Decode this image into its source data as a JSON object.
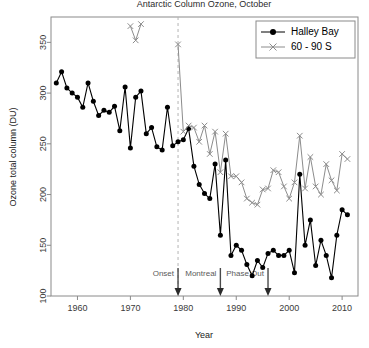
{
  "chart_data": {
    "type": "line",
    "title": "Antarctic Column Ozone, October",
    "xlabel": "Year",
    "ylabel": "Ozone total column (DU)",
    "xlim": [
      1955,
      2013
    ],
    "ylim": [
      100,
      375
    ],
    "xticks": [
      1960,
      1970,
      1980,
      1990,
      2000,
      2010
    ],
    "xticklabels": [
      "1960",
      "1970",
      "1980",
      "1990",
      "2000",
      "2010"
    ],
    "yticks": [
      100,
      150,
      200,
      250,
      300,
      350
    ],
    "yticklabels": [
      "100",
      "150",
      "200",
      "250",
      "300",
      "350"
    ],
    "grid": false,
    "legend_position": "top-right",
    "series": [
      {
        "name": "Halley Bay",
        "color": "#000000",
        "marker": "filled-circle",
        "x": [
          1956,
          1957,
          1958,
          1959,
          1960,
          1961,
          1962,
          1963,
          1964,
          1965,
          1966,
          1967,
          1968,
          1969,
          1970,
          1971,
          1972,
          1973,
          1974,
          1975,
          1976,
          1977,
          1978,
          1979,
          1980,
          1981,
          1982,
          1983,
          1984,
          1985,
          1986,
          1987,
          1988,
          1989,
          1990,
          1991,
          1992,
          1993,
          1994,
          1995,
          1996,
          1997,
          1998,
          1999,
          2000,
          2001,
          2002,
          2003,
          2004,
          2005,
          2006,
          2007,
          2008,
          2009,
          2010,
          2011
        ],
        "values": [
          310,
          321,
          305,
          300,
          296,
          286,
          310,
          292,
          278,
          283,
          281,
          287,
          263,
          306,
          246,
          296,
          302,
          260,
          266,
          247,
          244,
          286,
          248,
          252,
          254,
          265,
          228,
          210,
          201,
          196,
          230,
          160,
          234,
          140,
          150,
          145,
          131,
          120,
          135,
          128,
          142,
          145,
          140,
          140,
          145,
          123,
          220,
          150,
          175,
          130,
          155,
          140,
          118,
          160,
          185,
          180
        ]
      },
      {
        "name": "60 - 90 S",
        "color": "#8c8c8c",
        "marker": "x",
        "x": [
          1970,
          1971,
          1972,
          1979,
          1980,
          1981,
          1982,
          1983,
          1984,
          1985,
          1986,
          1987,
          1988,
          1989,
          1990,
          1991,
          1992,
          1993,
          1994,
          1995,
          1996,
          1997,
          1998,
          1999,
          2000,
          2001,
          2002,
          2003,
          2004,
          2005,
          2006,
          2007,
          2008,
          2009,
          2010,
          2011
        ],
        "values": [
          366,
          352,
          368,
          348,
          262,
          268,
          266,
          252,
          268,
          240,
          262,
          222,
          260,
          218,
          218,
          212,
          196,
          192,
          190,
          205,
          206,
          224,
          222,
          208,
          196,
          212,
          258,
          206,
          237,
          208,
          200,
          230,
          214,
          204,
          240,
          235
        ]
      }
    ],
    "annotations": [
      {
        "label": "Onset",
        "x": 1979,
        "vline": true
      },
      {
        "label": "Montreal",
        "x": 1987,
        "vline": false
      },
      {
        "label": "Phase Out",
        "x": 1996,
        "vline": false
      }
    ]
  }
}
